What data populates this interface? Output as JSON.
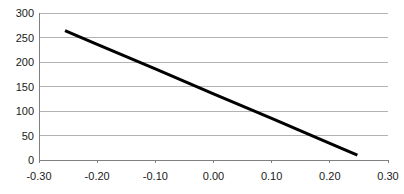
{
  "chart_data": {
    "type": "line",
    "title": "",
    "subtitle": "",
    "xlabel": "",
    "ylabel": "",
    "xlim": [
      -0.3,
      0.3
    ],
    "ylim": [
      0,
      300
    ],
    "xticks": [
      -0.3,
      -0.2,
      -0.1,
      0.0,
      0.1,
      0.2,
      0.3
    ],
    "xtick_labels": [
      "-0.30",
      "-0.20",
      "-0.10",
      "0.00",
      "0.10",
      "0.20",
      "0.30"
    ],
    "yticks": [
      0,
      50,
      100,
      150,
      200,
      250,
      300
    ],
    "ytick_labels": [
      "0",
      "50",
      "100",
      "150",
      "200",
      "250",
      "300"
    ],
    "grid": {
      "horizontal": true,
      "vertical": false,
      "color": "#b3b3b3"
    },
    "legend": {
      "visible": false,
      "position": "none"
    },
    "annotations": [],
    "series": [
      {
        "name": "series-1",
        "color": "#000000",
        "line_width": 3,
        "marker": "none",
        "x": [
          -0.2553,
          0.2474
        ],
        "values": [
          264,
          10
        ],
        "points": [
          {
            "x": -0.2553,
            "y": 264
          },
          {
            "x": -0.2,
            "y": 236
          },
          {
            "x": -0.1,
            "y": 186
          },
          {
            "x": 0.0,
            "y": 135
          },
          {
            "x": 0.1,
            "y": 85
          },
          {
            "x": 0.2,
            "y": 34
          },
          {
            "x": 0.2474,
            "y": 10
          }
        ]
      }
    ]
  },
  "axes": {
    "axis_line_color": "#808080",
    "background": "#ffffff",
    "y_axis_visible": true,
    "x_axis_visible": true
  }
}
